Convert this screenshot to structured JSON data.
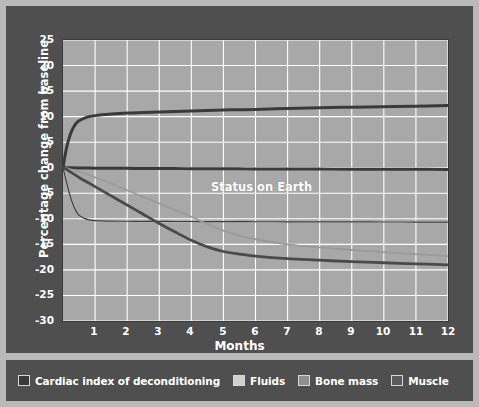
{
  "figure": {
    "background_color": "#b9b9b9",
    "panel_color": "#4f4f4f",
    "plot_background_color": "#a8a8a8",
    "grid_color": "#ffffff",
    "text_color": "#ffffff"
  },
  "annotations": {
    "status_on_earth": "Status on Earth"
  },
  "legend": {
    "items": [
      {
        "label": "Cardiac index of deconditioning",
        "color": "#3a3a3a"
      },
      {
        "label": "Fluids",
        "color": "#cfcfcf"
      },
      {
        "label": "Bone mass",
        "color": "#8f8f8f"
      },
      {
        "label": "Muscle",
        "color": "#5a5a5a"
      }
    ]
  },
  "chart_data": {
    "type": "line",
    "title": "",
    "subtitle": "",
    "xlabel": "Months",
    "ylabel": "Percentage change from baseline",
    "xlim": [
      0,
      12
    ],
    "ylim": [
      -30,
      25
    ],
    "xticks": [
      "1",
      "2",
      "3",
      "4",
      "5",
      "6",
      "7",
      "8",
      "9",
      "10",
      "11",
      "12"
    ],
    "yticks": [
      "25",
      "20",
      "15",
      "10",
      "5",
      "0",
      "-5",
      "-10",
      "-15",
      "-20",
      "-25",
      "-30"
    ],
    "grid": true,
    "legend_position": "below-figure",
    "annotations": [
      {
        "text": "Status on Earth",
        "x": 5.1,
        "y": 2.5
      }
    ],
    "x": [
      0,
      0.1,
      0.2,
      0.3,
      0.4,
      0.5,
      0.75,
      1,
      1.5,
      2,
      2.5,
      3,
      3.5,
      4,
      4.5,
      5,
      5.5,
      6,
      7,
      8,
      9,
      10,
      11,
      12
    ],
    "series": [
      {
        "name": "Cardiac index of deconditioning",
        "color": "#3a3a3a",
        "width": 3.0,
        "values": [
          0,
          3.6,
          6.0,
          7.6,
          8.6,
          9.2,
          9.9,
          10.2,
          10.5,
          10.7,
          10.8,
          10.9,
          11.0,
          11.1,
          11.2,
          11.3,
          11.35,
          11.4,
          11.6,
          11.75,
          11.85,
          11.95,
          12.05,
          12.2
        ]
      },
      {
        "name": "Status on Earth baseline",
        "color": "#3a3a3a",
        "width": 3.0,
        "values": [
          0,
          0,
          0,
          -0.02,
          -0.03,
          -0.04,
          -0.06,
          -0.08,
          -0.1,
          -0.12,
          -0.14,
          -0.15,
          -0.17,
          -0.18,
          -0.2,
          -0.21,
          -0.22,
          -0.23,
          -0.25,
          -0.27,
          -0.28,
          -0.3,
          -0.31,
          -0.33
        ]
      },
      {
        "name": "Fluids",
        "color": "#cfcfcf",
        "width": 1.6,
        "values": [
          0,
          -2.6,
          -5.0,
          -7.0,
          -8.4,
          -9.3,
          -10.1,
          -10.35,
          -10.45,
          -10.48,
          -10.5,
          -10.5,
          -10.52,
          -10.53,
          -10.54,
          -10.55,
          -10.56,
          -10.57,
          -10.58,
          -10.6,
          -10.6,
          -10.62,
          -10.63,
          -10.65
        ]
      },
      {
        "name": "Fluids dark overlay",
        "color": "#3a3a3a",
        "width": 1.2,
        "values": [
          0,
          -2.6,
          -5.0,
          -7.0,
          -8.4,
          -9.3,
          -10.1,
          -10.35,
          -10.45,
          -10.48,
          -10.5,
          -10.5,
          -10.52,
          -10.53,
          -10.54,
          -10.55,
          -10.56,
          -10.57,
          -10.58,
          -10.6,
          -10.6,
          -10.62,
          -10.63,
          -10.65
        ]
      },
      {
        "name": "Bone mass",
        "color": "#9a9a9a",
        "width": 1.8,
        "values": [
          0,
          -0.1,
          -0.25,
          -0.4,
          -0.6,
          -0.8,
          -1.3,
          -1.9,
          -3.1,
          -4.4,
          -5.7,
          -7.0,
          -8.3,
          -9.6,
          -11.0,
          -12.3,
          -13.3,
          -14.0,
          -15.0,
          -15.6,
          -16.1,
          -16.5,
          -16.9,
          -17.3
        ]
      },
      {
        "name": "Muscle",
        "color": "#4a4a4a",
        "width": 2.8,
        "values": [
          0,
          -0.3,
          -0.7,
          -1.1,
          -1.5,
          -1.9,
          -2.8,
          -3.7,
          -5.5,
          -7.3,
          -9.1,
          -10.9,
          -12.6,
          -14.2,
          -15.5,
          -16.4,
          -16.9,
          -17.3,
          -17.8,
          -18.1,
          -18.4,
          -18.6,
          -18.8,
          -19.0
        ]
      }
    ]
  }
}
